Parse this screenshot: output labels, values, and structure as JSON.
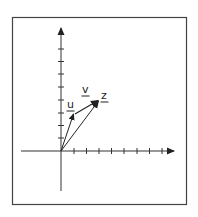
{
  "diagram": {
    "type": "vector-addition",
    "frame": {
      "stroke": "#3a3a3a"
    },
    "axes": {
      "color": "#2a2a2a",
      "x_ticks": 8,
      "y_ticks": 8,
      "unit_px": 12.6
    },
    "vectors": [
      {
        "name": "u",
        "label": "u",
        "from": [
          0,
          0
        ],
        "to": [
          1,
          3
        ]
      },
      {
        "name": "z",
        "label": "z",
        "from": [
          0,
          0
        ],
        "to": [
          3,
          4
        ]
      },
      {
        "name": "v",
        "label": "v",
        "from": [
          1,
          3
        ],
        "to": [
          3,
          4
        ]
      }
    ],
    "labels": {
      "u": "u",
      "v": "v",
      "z": "z"
    }
  }
}
